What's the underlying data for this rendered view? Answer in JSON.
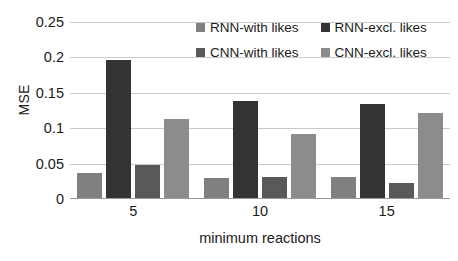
{
  "chart_data": {
    "type": "bar",
    "title": "",
    "xlabel": "minimum reactions",
    "ylabel": "MSE",
    "categories": [
      "5",
      "10",
      "15"
    ],
    "ylim": [
      0,
      0.25
    ],
    "yticks": [
      "0",
      "0.05",
      "0.1",
      "0.15",
      "0.2",
      "0.25"
    ],
    "ytick_values": [
      0,
      0.05,
      0.1,
      0.15,
      0.2,
      0.25
    ],
    "grid": true,
    "legend_position": "top-right-inside",
    "series": [
      {
        "name": "RNN-with likes",
        "color": "#808080",
        "values": [
          0.037,
          0.03,
          0.031
        ]
      },
      {
        "name": "RNN-excl. likes",
        "color": "#333333",
        "values": [
          0.196,
          0.138,
          0.134
        ]
      },
      {
        "name": "CNN-with likes",
        "color": "#595959",
        "values": [
          0.048,
          0.031,
          0.023
        ]
      },
      {
        "name": "CNN-excl. likes",
        "color": "#8c8c8c",
        "values": [
          0.113,
          0.092,
          0.122
        ]
      }
    ]
  },
  "colors": {
    "gridline": "#c9c9c9",
    "axis": "#9a9a9a",
    "text": "#1a1a1a",
    "background": "#ffffff"
  }
}
